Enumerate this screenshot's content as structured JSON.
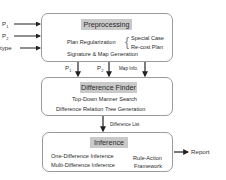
{
  "inputs": [
    {
      "label": "P",
      "sub": "1"
    },
    {
      "label": "P",
      "sub": "2"
    },
    {
      "label": "type",
      "sub": ""
    }
  ],
  "preprocessing": {
    "title": "Preprocessing",
    "plan_regularization": "Plan Regularization",
    "brace": "{",
    "options": [
      "Special Case",
      "Re-cost Plan"
    ],
    "signature": "Signature & Map Generation"
  },
  "connectors_1": [
    {
      "label": "P",
      "sub": "1",
      "sup": "'"
    },
    {
      "label": "P",
      "sub": "2",
      "sup": "'"
    },
    {
      "label": "Map Info.",
      "sub": "",
      "sup": ""
    }
  ],
  "difference_finder": {
    "title": "Difference Finder",
    "lines": [
      "Top-Down Manner Search",
      "Difference Relation Tree Generation"
    ]
  },
  "connector_2": {
    "label": "Difference List"
  },
  "inference": {
    "title": "Inference",
    "left_lines": [
      "One-Difference Inference",
      "Multi-Difference Inference"
    ],
    "right_lines": [
      "Rule-Action",
      "Framework"
    ]
  },
  "output": {
    "label": "Report"
  },
  "colors": {
    "title_bg": "#c9c9c9",
    "border": "#9a9a9a",
    "arrow": "#222222"
  }
}
